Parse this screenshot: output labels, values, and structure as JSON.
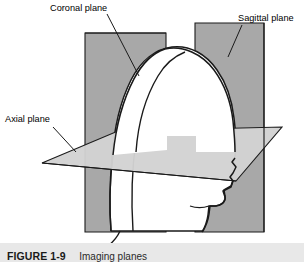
{
  "figure": {
    "caption_number": "FIGURE 1-9",
    "caption_description": "Imaging planes",
    "labels": {
      "coronal": "Coronal plane",
      "sagittal": "Sagittal plane",
      "axial": "Axial plane"
    },
    "colors": {
      "vertical_plane_fill": "#a8a8a8",
      "horizontal_plane_fill": "#d2d2d2",
      "head_fill": "#ffffff",
      "outline": "#1a1a1a",
      "caption_bar": "#e8e8e8",
      "background": "#ffffff"
    }
  }
}
